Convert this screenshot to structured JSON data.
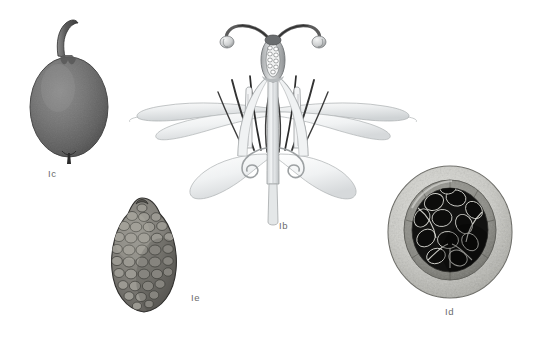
{
  "plate": {
    "background_color": "#ffffff",
    "width": 533,
    "height": 343,
    "style": "botanical-illustration-halftone"
  },
  "labels": {
    "fig_b": "Ib",
    "fig_c": "Ic",
    "fig_d": "Id",
    "fig_e": "Ie"
  },
  "label_color": "#6b6b6b",
  "figures": [
    {
      "id": "fig-c",
      "label": "Ic",
      "name": "ovoid-fruit-with-stalk",
      "description": "Dark grey ovoid fruit with curved stalk at apex and small beak at base",
      "x": 20,
      "y": 14,
      "width": 108,
      "height": 160,
      "label_x": 48,
      "label_y": 168,
      "fill_color": "#6f6f6f",
      "shade_dark": "#4a4a4a",
      "shade_light": "#8d8d8d",
      "outline_color": "#3a3a3a"
    },
    {
      "id": "fig-b",
      "label": "Ib",
      "name": "dissected-flower",
      "description": "Dissected flower: two recurved styles with pale stigmas, central ovary with ovules, dark filaments, pale staminodes, spreading pale tepals and pedicel",
      "x": 128,
      "y": 8,
      "width": 290,
      "height": 215,
      "label_x": 279,
      "label_y": 228,
      "tepal_color": "#eceded",
      "tepal_shade": "#cfd2d4",
      "filament_color": "#2e2e2e",
      "style_color": "#6a6a6a",
      "stigma_color": "#d9dadb",
      "outline_color": "#8e9192"
    },
    {
      "id": "fig-d",
      "label": "Id",
      "name": "fruit-cross-section",
      "description": "Circular transverse section of fruit showing granular pale pericarp, grey inner ring, and dense cluster of near-black seeds with pale highlights",
      "x": 382,
      "y": 160,
      "width": 140,
      "height": 150,
      "label_x": 445,
      "label_y": 312,
      "pericarp_color": "#cfcfcb",
      "pericarp_speckle": "#a8a8a3",
      "inner_ring_color": "#8f8f8a",
      "seed_color": "#0d0d0d",
      "seed_highlight": "#e2e2de",
      "outline_color": "#6d6d68"
    },
    {
      "id": "fig-e",
      "label": "Ie",
      "name": "reticulate-seed",
      "description": "Ovoid seed with pointed apex covered in honeycomb reticulate pattern of rounded cells",
      "x": 98,
      "y": 192,
      "width": 92,
      "height": 126,
      "label_x": 191,
      "label_y": 300,
      "fill_color": "#7d7b76",
      "cell_color": "#96948e",
      "cell_outline": "#3f3e3b",
      "outline_color": "#2f2e2c"
    }
  ]
}
